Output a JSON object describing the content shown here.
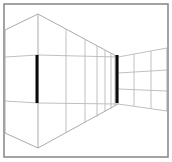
{
  "figure": {
    "type": "line-drawing",
    "width": 172,
    "height": 162,
    "background_color": "#ffffff"
  },
  "frame": {
    "name": "outer border",
    "x": 4,
    "y": 4,
    "width": 164,
    "height": 153,
    "stroke_color": "#8c8c8c",
    "stroke_width": 1.6
  },
  "style": {
    "line_color": "#b9b9b9",
    "line_color_strong": "#a0a0a0",
    "line_width": 0.9,
    "bar_color": "#0a0a0a"
  },
  "geometry": {
    "near_corner_x": 38,
    "far_corner_x": 118,
    "ceiling_near_y": 14,
    "ceiling_far_y": 57,
    "floor_near_y": 148,
    "floor_far_y": 104,
    "band_upper_near_y": 55,
    "band_lower_near_y": 103,
    "band_upper_far_y": 57,
    "band_lower_far_y": 104
  },
  "chart_data": {
    "type": "line",
    "xlabel": "",
    "ylabel": "",
    "xlim": [
      0,
      172
    ],
    "ylim": [
      162,
      0
    ],
    "grid": false,
    "legend": "none",
    "annotations": [
      "Two black vertical bars of equal pixel length placed at the near corner and the far corner of a receding corridor."
    ],
    "elements": [
      {
        "name": "left-wall-ceiling-edge",
        "kind": "polyline",
        "points": [
          [
            5,
            30
          ],
          [
            38,
            14
          ]
        ]
      },
      {
        "name": "left-wall-floor-edge",
        "kind": "polyline",
        "points": [
          [
            5,
            133
          ],
          [
            38,
            148
          ]
        ]
      },
      {
        "name": "left-wall-upper-band",
        "kind": "polyline",
        "points": [
          [
            5,
            57
          ],
          [
            38,
            55
          ]
        ]
      },
      {
        "name": "left-wall-lower-band",
        "kind": "polyline",
        "points": [
          [
            5,
            101
          ],
          [
            38,
            103
          ]
        ]
      },
      {
        "name": "left-wall-vertical-edge",
        "kind": "polyline",
        "points": [
          [
            5,
            30
          ],
          [
            5,
            133
          ]
        ]
      },
      {
        "name": "corridor-ceiling-line",
        "kind": "polyline",
        "points": [
          [
            38,
            14
          ],
          [
            118,
            57
          ]
        ]
      },
      {
        "name": "corridor-floor-line",
        "kind": "polyline",
        "points": [
          [
            38,
            148
          ],
          [
            118,
            104
          ]
        ]
      },
      {
        "name": "corridor-upper-band-line",
        "kind": "polyline",
        "points": [
          [
            38,
            55
          ],
          [
            118,
            57
          ]
        ]
      },
      {
        "name": "corridor-lower-band-line",
        "kind": "polyline",
        "points": [
          [
            38,
            103
          ],
          [
            118,
            104
          ]
        ]
      },
      {
        "name": "near-corner-vertical",
        "kind": "polyline",
        "points": [
          [
            38,
            14
          ],
          [
            38,
            148
          ]
        ]
      },
      {
        "name": "far-corner-vertical",
        "kind": "polyline",
        "points": [
          [
            118,
            57
          ],
          [
            118,
            104
          ]
        ]
      },
      {
        "name": "mullion-1",
        "kind": "polyline",
        "points": [
          [
            66,
            29
          ],
          [
            66,
            133
          ]
        ]
      },
      {
        "name": "mullion-2",
        "kind": "polyline",
        "points": [
          [
            85,
            39
          ],
          [
            85,
            123
          ]
        ]
      },
      {
        "name": "mullion-3",
        "kind": "polyline",
        "points": [
          [
            97,
            46
          ],
          [
            97,
            117
          ]
        ]
      },
      {
        "name": "mullion-4",
        "kind": "polyline",
        "points": [
          [
            105,
            50
          ],
          [
            105,
            112
          ]
        ]
      },
      {
        "name": "mullion-5",
        "kind": "polyline",
        "points": [
          [
            111,
            53
          ],
          [
            111,
            109
          ]
        ]
      },
      {
        "name": "mullion-6",
        "kind": "polyline",
        "points": [
          [
            115,
            55
          ],
          [
            115,
            106
          ]
        ]
      },
      {
        "name": "far-wall-top-edge",
        "kind": "polyline",
        "points": [
          [
            118,
            57
          ],
          [
            167,
            48
          ]
        ]
      },
      {
        "name": "far-wall-bottom-edge",
        "kind": "polyline",
        "points": [
          [
            118,
            104
          ],
          [
            167,
            111
          ]
        ]
      },
      {
        "name": "far-wall-row-line-1",
        "kind": "polyline",
        "points": [
          [
            118,
            73
          ],
          [
            167,
            70
          ]
        ]
      },
      {
        "name": "far-wall-row-line-2",
        "kind": "polyline",
        "points": [
          [
            118,
            89
          ],
          [
            167,
            91
          ]
        ]
      },
      {
        "name": "far-wall-col-line-1",
        "kind": "polyline",
        "points": [
          [
            134,
            54
          ],
          [
            134,
            106
          ]
        ]
      },
      {
        "name": "far-wall-col-line-2",
        "kind": "polyline",
        "points": [
          [
            151,
            51
          ],
          [
            151,
            109
          ]
        ]
      },
      {
        "name": "right-edge-vertical",
        "kind": "polyline",
        "points": [
          [
            167,
            48
          ],
          [
            167,
            111
          ]
        ]
      }
    ],
    "bars": [
      {
        "name": "near-bar",
        "label": "near vertical bar",
        "x": 37,
        "y_top": 55,
        "y_bottom": 103,
        "length": 48,
        "width": 3,
        "color": "#0a0a0a"
      },
      {
        "name": "far-bar",
        "label": "far vertical bar",
        "x": 117,
        "y_top": 55,
        "y_bottom": 103,
        "length": 48,
        "width": 3,
        "color": "#0a0a0a"
      }
    ]
  }
}
